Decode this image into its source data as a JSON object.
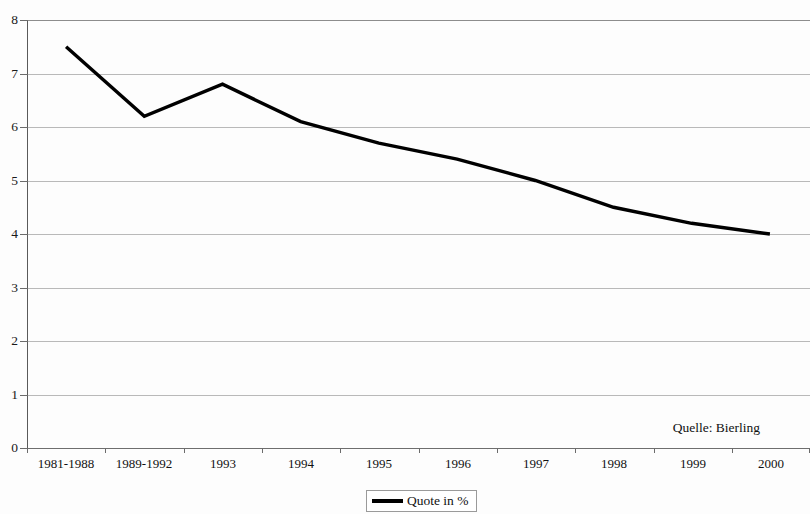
{
  "chart_data": {
    "type": "line",
    "title": "",
    "subtitle": "",
    "xlabel": "",
    "ylabel": "",
    "categories": [
      "1981-1988",
      "1989-1992",
      "1993",
      "1994",
      "1995",
      "1996",
      "1997",
      "1998",
      "1999",
      "2000"
    ],
    "series": [
      {
        "name": "Quote in %",
        "values": [
          7.5,
          6.2,
          6.8,
          6.1,
          5.7,
          5.4,
          5.0,
          4.5,
          4.2,
          4.0
        ],
        "color": "#000000"
      }
    ],
    "ylim": [
      0,
      8
    ],
    "yticks": [
      0,
      1,
      2,
      3,
      4,
      5,
      6,
      7,
      8
    ],
    "ytick_labels": [
      "0",
      "1",
      "2",
      "3",
      "4",
      "5",
      "6",
      "7",
      "8"
    ],
    "grid": true,
    "grid_axis": "y",
    "legend_position": "bottom-center",
    "annotations": [
      {
        "name": "source-note",
        "text": "Quelle: Bierling"
      }
    ]
  },
  "legend": {
    "entries": [
      {
        "label": "Quote in %"
      }
    ]
  },
  "source": {
    "text": "Quelle: Bierling"
  }
}
